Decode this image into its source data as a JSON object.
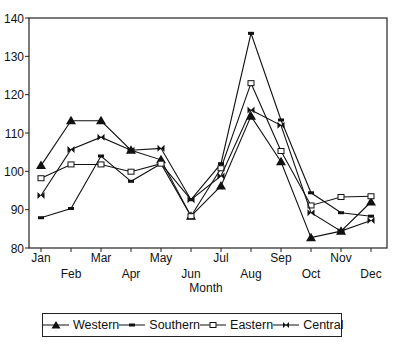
{
  "chart_data": {
    "type": "line",
    "title": "",
    "xlabel": "Month",
    "ylabel": "",
    "ylim": [
      80,
      140
    ],
    "yticks": [
      80,
      90,
      100,
      110,
      120,
      130,
      140
    ],
    "grid": false,
    "legend_position": "bottom",
    "categories": [
      "Jan",
      "Feb",
      "Mar",
      "Apr",
      "May",
      "Jun",
      "Jul",
      "Aug",
      "Sep",
      "Oct",
      "Nov",
      "Dec"
    ],
    "series": [
      {
        "name": "Western",
        "marker": "triangle",
        "values": [
          101.5,
          113.2,
          113.2,
          105.5,
          103.0,
          88.3,
          96.2,
          114.4,
          102.5,
          82.7,
          84.4,
          92.0
        ]
      },
      {
        "name": "Southern",
        "marker": "dash",
        "values": [
          87.9,
          90.3,
          104.0,
          97.4,
          102.0,
          92.6,
          102.0,
          136.0,
          113.4,
          94.4,
          89.2,
          88.3
        ]
      },
      {
        "name": "Eastern",
        "marker": "square",
        "values": [
          98.2,
          101.8,
          101.8,
          99.9,
          102.0,
          88.3,
          100.8,
          123.0,
          105.3,
          91.1,
          93.3,
          93.5
        ]
      },
      {
        "name": "Central",
        "marker": "bowtie",
        "values": [
          93.7,
          105.7,
          108.9,
          105.5,
          106.0,
          92.6,
          98.8,
          116.0,
          112.0,
          89.2,
          84.4,
          87.2
        ]
      }
    ]
  },
  "legend": {
    "items": [
      {
        "label": "Western"
      },
      {
        "label": "Southern"
      },
      {
        "label": "Eastern"
      },
      {
        "label": "Central"
      }
    ]
  }
}
